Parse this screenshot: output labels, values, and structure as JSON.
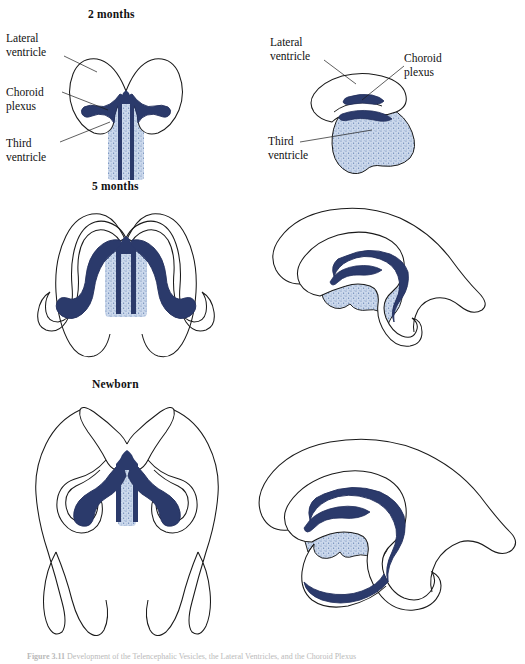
{
  "figure": {
    "caption_number": "Figure 3.11",
    "caption_text": "Development of the Telencephalic Vesicles, the Lateral Ventricles, and the Choroid Plexus",
    "background_color": "#ffffff"
  },
  "colors": {
    "outline": "#1a1a1a",
    "choroid_plexus": "#2b3a6b",
    "choroid_plexus_dark": "#222f5c",
    "ventricle_fill": "#c3d2e8",
    "ventricle_stipple": "#5b7bb0",
    "label_text": "#111111"
  },
  "panels": [
    {
      "id": "two-months-coronal",
      "title": "2 months",
      "view": "coronal",
      "stage": "2 months",
      "labels": [
        {
          "id": "lateral-ventricle",
          "text": "Lateral\nventricle"
        },
        {
          "id": "choroid-plexus",
          "text": "Choroid\nplexus"
        },
        {
          "id": "third-ventricle",
          "text": "Third\nventricle"
        }
      ]
    },
    {
      "id": "two-months-sagittal",
      "title": "",
      "view": "sagittal",
      "stage": "2 months",
      "labels": [
        {
          "id": "lateral-ventricle",
          "text": "Lateral\nventricle"
        },
        {
          "id": "choroid-plexus",
          "text": "Choroid\nplexus"
        },
        {
          "id": "third-ventricle",
          "text": "Third\nventricle"
        }
      ]
    },
    {
      "id": "five-months-coronal",
      "title": "5 months",
      "view": "coronal",
      "stage": "5 months",
      "labels": []
    },
    {
      "id": "five-months-sagittal",
      "title": "",
      "view": "sagittal",
      "stage": "5 months",
      "labels": []
    },
    {
      "id": "newborn-coronal",
      "title": "Newborn",
      "view": "coronal",
      "stage": "Newborn",
      "labels": []
    },
    {
      "id": "newborn-sagittal",
      "title": "",
      "view": "sagittal",
      "stage": "Newborn",
      "labels": []
    }
  ],
  "annotations": {
    "lateral_ventricle_left": "Lateral\nventricle",
    "choroid_plexus_left": "Choroid\nplexus",
    "third_ventricle_left": "Third\nventricle",
    "lateral_ventricle_right": "Lateral\nventricle",
    "choroid_plexus_right": "Choroid\nplexus",
    "third_ventricle_right": "Third\nventricle"
  }
}
